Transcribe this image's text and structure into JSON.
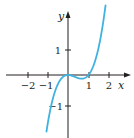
{
  "chart_data": {
    "type": "line",
    "title": "",
    "xlabel": "x",
    "ylabel": "y",
    "xlim": [
      -2.8,
      3.0
    ],
    "ylim": [
      -2.5,
      2.6
    ],
    "grid": false,
    "x_ticks": [
      "-2",
      "-1",
      "1",
      "2"
    ],
    "y_ticks": [
      "1",
      "-1"
    ],
    "series": [
      {
        "name": "y = x^3 - x^2",
        "color": "#3fb3e0",
        "x": [
          -1.05,
          -0.8,
          -0.5,
          -0.25,
          0,
          0.25,
          0.5,
          0.667,
          0.8,
          1.0,
          1.25,
          1.5,
          1.7,
          1.83
        ],
        "y": [
          -2.26,
          -1.15,
          -0.375,
          -0.078,
          0,
          -0.047,
          -0.125,
          -0.148,
          -0.128,
          0,
          0.391,
          1.125,
          2.023,
          2.6
        ]
      }
    ]
  },
  "labels": {
    "x_axis": "x",
    "y_axis": "y",
    "tick_xm2": "−2",
    "tick_xm1": "−1",
    "tick_x1": "1",
    "tick_x2": "2",
    "tick_y1": "1",
    "tick_ym1": "−1"
  },
  "colors": {
    "curve": "#3fb3e0",
    "axes": "#231f20"
  }
}
